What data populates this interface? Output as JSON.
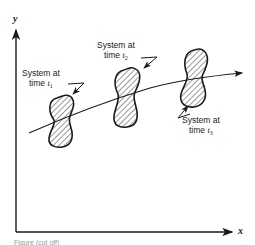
{
  "diagram": {
    "axes": {
      "y_label": "y",
      "x_label": "x"
    },
    "labels": [
      {
        "line1": "System at",
        "line2": "time",
        "var": "t",
        "sub": "1"
      },
      {
        "line1": "System at",
        "line2": "time",
        "var": "t",
        "sub": "2"
      },
      {
        "line1": "System at",
        "line2": "time",
        "var": "t",
        "sub": "3"
      }
    ],
    "elements": {
      "trajectory": "curved path with arrow passing through three hatched system regions",
      "blobs": 3
    },
    "colors": {
      "stroke": "#1a1a1a",
      "background": "#ffffff"
    },
    "caption": "Figure (cut off)"
  }
}
